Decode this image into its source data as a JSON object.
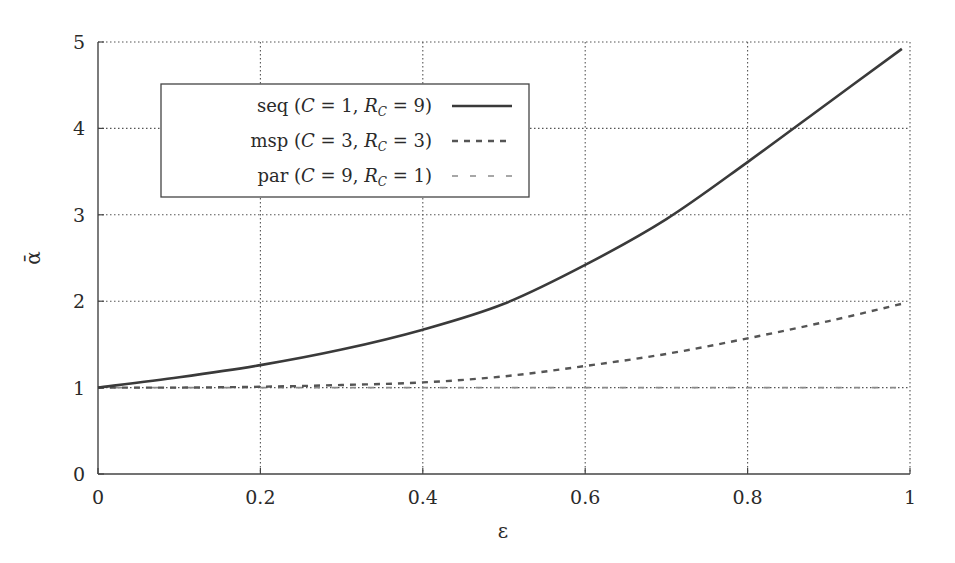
{
  "chart_data": {
    "type": "line",
    "title": "",
    "xlabel": "ε",
    "ylabel": "ᾱ",
    "xlim": [
      0,
      1
    ],
    "ylim": [
      0,
      5
    ],
    "xticks": [
      0,
      0.2,
      0.4,
      0.6,
      0.8,
      1
    ],
    "xtick_labels": [
      "0",
      "0.2",
      "0.4",
      "0.6",
      "0.8",
      "1"
    ],
    "yticks": [
      0,
      1,
      2,
      3,
      4,
      5
    ],
    "ytick_labels": [
      "0",
      "1",
      "2",
      "3",
      "4",
      "5"
    ],
    "grid": true,
    "legend_position": "upper left",
    "x": [
      0,
      0.1,
      0.2,
      0.3,
      0.4,
      0.5,
      0.6,
      0.7,
      0.8,
      0.9,
      0.99
    ],
    "series": [
      {
        "name": "seq (C = 1, R_C = 9)",
        "label_parts": [
          "seq (",
          "C",
          " = 1, ",
          "R",
          "C",
          " = 9)"
        ],
        "style": "solid",
        "color": "#3a3a3a",
        "values": [
          1.0,
          1.12,
          1.26,
          1.44,
          1.67,
          1.97,
          2.42,
          2.95,
          3.61,
          4.3,
          4.92
        ]
      },
      {
        "name": "msp (C = 3, R_C = 3)",
        "label_parts": [
          "msp (",
          "C",
          " = 3, ",
          "R",
          "C",
          " = 3)"
        ],
        "style": "dashed",
        "color": "#555555",
        "values": [
          1.0,
          1.0,
          1.01,
          1.03,
          1.06,
          1.13,
          1.25,
          1.39,
          1.57,
          1.77,
          1.97
        ]
      },
      {
        "name": "par (C = 9, R_C = 1)",
        "label_parts": [
          "par (",
          "C",
          " = 9, ",
          "R",
          "C",
          " = 1)"
        ],
        "style": "loosely-dashed",
        "color": "#8a8a8a",
        "values": [
          1.0,
          1.0,
          1.0,
          1.0,
          1.0,
          1.0,
          1.0,
          1.0,
          1.0,
          1.0,
          1.0
        ]
      }
    ]
  }
}
